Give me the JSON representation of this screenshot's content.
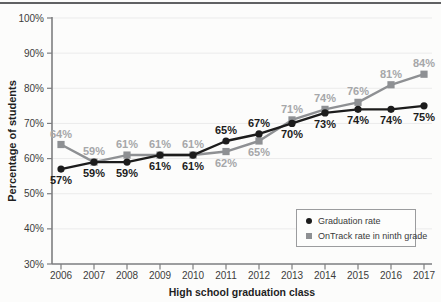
{
  "figure": {
    "top_rule_color": "#606163"
  },
  "chart_data": {
    "type": "line",
    "title": "",
    "xlabel": "High school graduation class",
    "ylabel": "Percentage of students",
    "x": [
      2006,
      2007,
      2008,
      2009,
      2010,
      2011,
      2012,
      2013,
      2014,
      2015,
      2016,
      2017
    ],
    "ylim": [
      30,
      100
    ],
    "ytick_step": 10,
    "ytick_suffix": "%",
    "grid": true,
    "gridline_color": "#ebebeb",
    "axis_color": "#7d7e80",
    "tick_label_color": "#3c3c3c",
    "axis_title_color": "#1f1f1f",
    "legend_position": "inside-bottom-right",
    "data_labels": true,
    "data_label_suffix": "%",
    "series": [
      {
        "name": "Graduation rate",
        "marker": "circle",
        "color": "#1c1c1c",
        "label_color": "#1c1c1c",
        "values": [
          57,
          59,
          59,
          61,
          61,
          65,
          67,
          70,
          73,
          74,
          74,
          75
        ]
      },
      {
        "name": "OnTrack rate in ninth grade",
        "marker": "square",
        "color": "#8e9093",
        "label_color": "#a6a7a9",
        "values": [
          64,
          59,
          61,
          61,
          61,
          62,
          65,
          71,
          74,
          76,
          81,
          84
        ]
      }
    ]
  }
}
